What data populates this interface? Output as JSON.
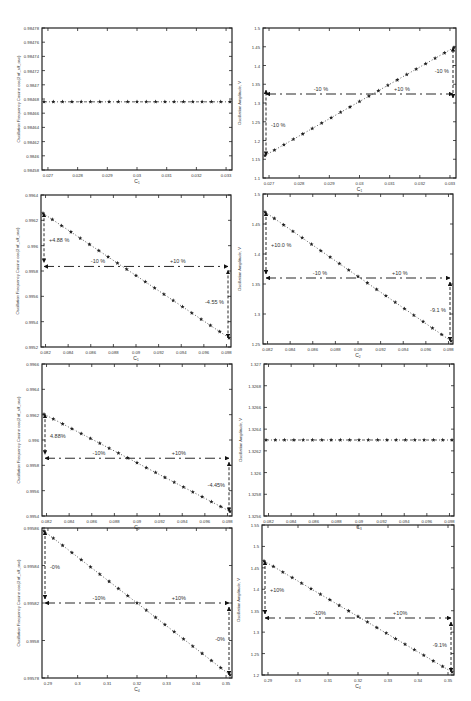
{
  "chart_data": [
    {
      "id": "p1",
      "type": "line",
      "title": "",
      "xlabel": "C1",
      "ylabel": "Oscillation Frequency Cosine cos(2π*f_sampling/f_osc)",
      "xlim": [
        0.027,
        0.033
      ],
      "ylim": [
        0.98458,
        0.98478
      ],
      "xticks": [
        "0.027",
        "0.028",
        "0.029",
        "0.03",
        "0.031",
        "0.032",
        "0.033"
      ],
      "yticks": [
        "0.98458",
        "0.9846",
        "0.98462",
        "0.98464",
        "0.98466",
        "0.98468",
        "0.9847",
        "0.98472",
        "0.98474",
        "0.98476",
        "0.98478"
      ],
      "series": [
        {
          "name": "C1 sweep",
          "x": [
            0.027,
            0.033
          ],
          "values": [
            0.984685,
            0.984685
          ],
          "flat": true
        }
      ],
      "reference_line": null,
      "annotations": []
    },
    {
      "id": "p2",
      "type": "line",
      "xlabel": "C1",
      "ylabel": "Oscillation Amplitude, V",
      "xlim": [
        0.027,
        0.033
      ],
      "ylim": [
        1.1,
        1.5
      ],
      "xticks": [
        "0.027",
        "0.028",
        "0.029",
        "0.03",
        "0.031",
        "0.032",
        "0.033"
      ],
      "yticks": [
        "1.1",
        "1.15",
        "1.2",
        "1.25",
        "1.3",
        "1.35",
        "1.4",
        "1.45",
        "1.5"
      ],
      "series": [
        {
          "name": "C1 sweep",
          "x": [
            0.027,
            0.033
          ],
          "values": [
            1.195,
            1.455
          ]
        }
      ],
      "reference_line": 1.325,
      "annotations": [
        "-10 %",
        "+10 %",
        "-10 %",
        "-10 %"
      ]
    },
    {
      "id": "p3",
      "type": "line",
      "xlabel": "C1",
      "ylabel": "Oscillation Frequency Cosine cos(2π*f_sampling/f_osc)",
      "xlim": [
        0.081,
        0.099
      ],
      "ylim": [
        0.9952,
        0.9964
      ],
      "xticks": [
        "0.082",
        "0.084",
        "0.086",
        "0.088",
        "0.09",
        "0.092",
        "0.094",
        "0.096",
        "0.098"
      ],
      "yticks": [
        "0.9952",
        "0.9954",
        "0.9956",
        "0.9958",
        "0.996",
        "0.9962",
        "0.9964"
      ],
      "series": [
        {
          "name": "C1 sweep",
          "x": [
            0.081,
            0.099
          ],
          "values": [
            0.99625,
            0.99538
          ]
        }
      ],
      "reference_line": 0.99582,
      "annotations": [
        "+4.88 %",
        "-10 %",
        "+10 %",
        "-4.55 %"
      ]
    },
    {
      "id": "p4",
      "type": "line",
      "xlabel": "C2",
      "ylabel": "Oscillation Amplitude, V",
      "xlim": [
        0.081,
        0.099
      ],
      "ylim": [
        1.2,
        1.5
      ],
      "xticks": [
        "0.082",
        "0.084",
        "0.086",
        "0.088",
        "0.09",
        "0.092",
        "0.094",
        "0.096",
        "0.098"
      ],
      "yticks": [
        "1.25",
        "1.3",
        "1.35",
        "1.4",
        "1.45",
        "1.5"
      ],
      "series": [
        {
          "name": "C2 sweep",
          "x": [
            0.081,
            0.099
          ],
          "values": [
            1.458,
            1.202
          ]
        }
      ],
      "reference_line": 1.325,
      "annotations": [
        "+10.0 %",
        "-10 %",
        "+10 %",
        "-9.1 %"
      ]
    },
    {
      "id": "p5",
      "type": "line",
      "xlabel": "C2",
      "ylabel": "Oscillation Frequency Cosine cos(2π*f_sampling/f_osc)",
      "xlim": [
        0.081,
        0.099
      ],
      "ylim": [
        0.9954,
        0.9966
      ],
      "xticks": [
        "0.082",
        "0.084",
        "0.086",
        "0.088",
        "0.09",
        "0.092",
        "0.094",
        "0.096",
        "0.098"
      ],
      "yticks": [
        "0.9954",
        "0.9956",
        "0.9958",
        "0.996",
        "0.9962",
        "0.9964",
        "0.9966"
      ],
      "series": [
        {
          "name": "C2 sweep",
          "x": [
            0.081,
            0.099
          ],
          "values": [
            0.99622,
            0.99542
          ]
        }
      ],
      "reference_line": 0.99582,
      "annotations": [
        "4.88%",
        "-10%",
        "+10%",
        "-4.45%"
      ]
    },
    {
      "id": "p6",
      "type": "line",
      "xlabel": "C3",
      "ylabel": "Oscillation Amplitude, V",
      "xlim": [
        0.081,
        0.099
      ],
      "ylim": [
        1.3257,
        1.3272
      ],
      "xticks": [
        "0.082",
        "0.084",
        "0.086",
        "0.088",
        "0.09",
        "0.092",
        "0.094",
        "0.096",
        "0.098"
      ],
      "yticks": [
        "1.3258",
        "1.3259",
        "1.326",
        "1.3261",
        "1.3262",
        "1.3263",
        "1.3264",
        "1.3265",
        "1.3266",
        "1.3267",
        "1.327",
        "1.3271"
      ],
      "ytick_display": [
        "1.3258",
        "1.3259",
        "1.326",
        "1.3262",
        "1.3264",
        "1.3266",
        "1.3268",
        "1.327"
      ],
      "series": [
        {
          "name": "C3 sweep",
          "x": [
            0.081,
            0.099
          ],
          "values": [
            1.3263,
            1.3263
          ],
          "flat": true
        }
      ],
      "reference_line": null,
      "annotations": []
    },
    {
      "id": "p7",
      "type": "line",
      "xlabel": "C4",
      "ylabel": "Oscillation Frequency Cosine cos(2π*f_sampling/f_osc)",
      "xlim": [
        0.288,
        0.352
      ],
      "ylim": [
        0.9967,
        0.99585
      ],
      "xticks": [
        "0.29",
        "0.3",
        "0.31",
        "0.32",
        "0.33",
        "0.34",
        "0.35"
      ],
      "yticks": [
        "0.99578",
        "0.9958",
        "0.99582",
        "0.99584",
        "0.99586"
      ],
      "series": [
        {
          "name": "C4 sweep",
          "x": [
            0.288,
            0.352
          ],
          "values": [
            0.995865,
            0.995775
          ]
        }
      ],
      "reference_line": 0.99582,
      "annotations": [
        "-0%",
        "-10%",
        "+10%",
        "-0%"
      ]
    },
    {
      "id": "p8",
      "type": "line",
      "xlabel": "C4",
      "ylabel": "Oscillation Amplitude, V",
      "xlim": [
        0.288,
        0.352
      ],
      "ylim": [
        1.2,
        1.55
      ],
      "xticks": [
        "0.29",
        "0.3",
        "0.31",
        "0.32",
        "0.33",
        "0.34",
        "0.35"
      ],
      "yticks": [
        "1.2",
        "1.25",
        "1.3",
        "1.35",
        "1.4",
        "1.45",
        "1.5",
        "1.55"
      ],
      "series": [
        {
          "name": "C4 sweep",
          "x": [
            0.288,
            0.352
          ],
          "values": [
            1.46,
            1.205
          ]
        }
      ],
      "reference_line": 1.325,
      "annotations": [
        "+10%",
        "-10%",
        "+10%",
        "-9.1%"
      ]
    }
  ],
  "panels": [
    {
      "xlabel": "C₁",
      "ylabel": "Oscillation Frequency Cosine cos(2πf_s/f_osc)",
      "yticks": [
        "0.98478",
        "0.98476",
        "0.98474",
        "0.98472",
        "0.9847",
        "0.98468",
        "0.98466",
        "0.98464",
        "0.98462",
        "0.9846",
        "0.98458"
      ],
      "xticks": [
        "0.027",
        "0.028",
        "0.029",
        "0.03",
        "0.031",
        "0.032",
        "0.033"
      ],
      "ann": {
        "left": "",
        "mid_l": "",
        "mid_r": "",
        "right": ""
      }
    },
    {
      "xlabel": "C₁",
      "ylabel": "Oscillation Amplitude, V",
      "yticks": [
        "1.5",
        "1.45",
        "1.4",
        "1.35",
        "1.3",
        "1.25",
        "1.2",
        "1.15",
        "1.1"
      ],
      "xticks": [
        "0.027",
        "0.028",
        "0.029",
        "0.03",
        "0.031",
        "0.032",
        "0.033"
      ],
      "ann": {
        "left": "-10 %",
        "mid_l": "-10 %",
        "mid_r": "+10 %",
        "right": "-10 %"
      }
    },
    {
      "xlabel": "C₁",
      "ylabel": "Oscillation Frequency Cosine cos(2πf_s/f_osc)",
      "yticks": [
        "0.9964",
        "0.9962",
        "0.996",
        "0.9958",
        "0.9956",
        "0.9954",
        "0.9952"
      ],
      "xticks": [
        "0.082",
        "0.084",
        "0.086",
        "0.088",
        "0.09",
        "0.092",
        "0.094",
        "0.096",
        "0.098"
      ],
      "ann": {
        "left": "+4.88 %",
        "mid_l": "-10 %",
        "mid_r": "+10 %",
        "right": "-4.55 %"
      }
    },
    {
      "xlabel": "C₂",
      "ylabel": "Oscillation Amplitude, V",
      "yticks": [
        "1.5",
        "1.45",
        "1.4",
        "1.35",
        "1.3",
        "1.25"
      ],
      "xticks": [
        "0.082",
        "0.084",
        "0.086",
        "0.088",
        "0.09",
        "0.092",
        "0.094",
        "0.096",
        "0.098"
      ],
      "ann": {
        "left": "+10.0 %",
        "mid_l": "-10 %",
        "mid_r": "+10 %",
        "right": "-9.1 %"
      }
    },
    {
      "xlabel": "C₂",
      "ylabel": "Oscillation Frequency Cosine cos(2πf_s/f_osc)",
      "yticks": [
        "0.9966",
        "0.9964",
        "0.9962",
        "0.996",
        "0.9958",
        "0.9956",
        "0.9954"
      ],
      "xticks": [
        "0.082",
        "0.084",
        "0.086",
        "0.088",
        "0.09",
        "0.092",
        "0.094",
        "0.096",
        "0.098"
      ],
      "ann": {
        "left": "4.88%",
        "mid_l": "-10%",
        "mid_r": "+10%",
        "right": "-4.45%"
      }
    },
    {
      "xlabel": "C₃",
      "ylabel": "Oscillation Amplitude, V",
      "yticks": [
        "1.327",
        "1.3268",
        "1.3266",
        "1.3264",
        "1.3262",
        "1.326",
        "1.3258",
        "1.3256"
      ],
      "xticks": [
        "0.082",
        "0.084",
        "0.086",
        "0.088",
        "0.09",
        "0.092",
        "0.094",
        "0.096",
        "0.098"
      ],
      "ann": {
        "left": "",
        "mid_l": "",
        "mid_r": "",
        "right": ""
      }
    },
    {
      "xlabel": "C₄",
      "ylabel": "Oscillation Frequency Cosine cos(2πf_s/f_osc)",
      "yticks": [
        "0.99586",
        "0.99584",
        "0.99582",
        "0.9958",
        "0.99578"
      ],
      "xticks": [
        "0.29",
        "0.3",
        "0.31",
        "0.32",
        "0.33",
        "0.34",
        "0.35"
      ],
      "ann": {
        "left": "-0%",
        "mid_l": "-10%",
        "mid_r": "+10%",
        "right": "-0%"
      }
    },
    {
      "xlabel": "C₄",
      "ylabel": "Oscillation Amplitude, V",
      "yticks": [
        "1.55",
        "1.5",
        "1.45",
        "1.4",
        "1.35",
        "1.3",
        "1.25",
        "1.2"
      ],
      "xticks": [
        "0.29",
        "0.3",
        "0.31",
        "0.32",
        "0.33",
        "0.34",
        "0.35"
      ],
      "ann": {
        "left": "+10%",
        "mid_l": "-10%",
        "mid_r": "+10%",
        "right": "-9.1%"
      }
    }
  ]
}
